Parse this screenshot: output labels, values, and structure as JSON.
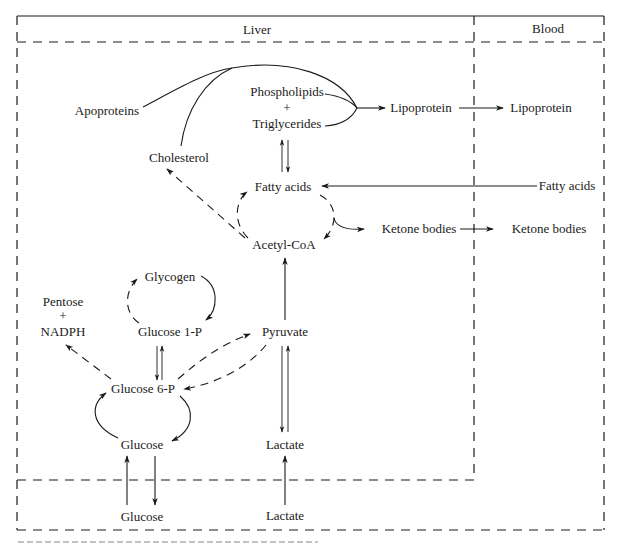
{
  "regions": {
    "liver": "Liver",
    "blood": "Blood"
  },
  "nodes": {
    "apoproteins": "Apoproteins",
    "phospholipids": "Phospholipids",
    "plus1": "+",
    "triglycerides": "Triglycerides",
    "lipoprotein_liver": "Lipoprotein",
    "lipoprotein_blood": "Lipoprotein",
    "cholesterol": "Cholesterol",
    "fatty_acids_liver": "Fatty acids",
    "fatty_acids_blood": "Fatty acids",
    "ketone_bodies_liver": "Ketone bodies",
    "ketone_bodies_blood": "Ketone bodies",
    "acetyl_coa": "Acetyl-CoA",
    "glycogen": "Glycogen",
    "pentose": "Pentose",
    "plus2": "+",
    "nadph": "NADPH",
    "glucose_1p": "Glucose 1-P",
    "pyruvate": "Pyruvate",
    "glucose_6p": "Glucose 6-P",
    "glucose_liver": "Glucose",
    "lactate_liver": "Lactate",
    "glucose_blood": "Glucose",
    "lactate_blood": "Lactate"
  },
  "edges": [
    {
      "from": "Apoproteins",
      "to": "Lipoprotein",
      "style": "solid"
    },
    {
      "from": "Cholesterol",
      "to": "Lipoprotein",
      "style": "solid"
    },
    {
      "from": "Phospholipids + Triglycerides",
      "to": "Lipoprotein",
      "style": "solid"
    },
    {
      "from": "Lipoprotein (liver)",
      "to": "Lipoprotein (blood)",
      "style": "solid"
    },
    {
      "from": "Triglycerides",
      "to": "Fatty acids",
      "style": "solid",
      "bidirectional": true
    },
    {
      "from": "Fatty acids (blood)",
      "to": "Fatty acids (liver)",
      "style": "solid"
    },
    {
      "from": "Fatty acids",
      "to": "Acetyl-CoA",
      "style": "dashed"
    },
    {
      "from": "Acetyl-CoA",
      "to": "Fatty acids",
      "style": "dashed"
    },
    {
      "from": "Acetyl-CoA",
      "to": "Cholesterol",
      "style": "dashed"
    },
    {
      "from": "Acetyl-CoA/Fatty acids cycle",
      "to": "Ketone bodies",
      "style": "solid"
    },
    {
      "from": "Ketone bodies (liver)",
      "to": "Ketone bodies (blood)",
      "style": "solid"
    },
    {
      "from": "Pyruvate",
      "to": "Acetyl-CoA",
      "style": "solid"
    },
    {
      "from": "Glycogen",
      "to": "Glucose 1-P",
      "style": "solid"
    },
    {
      "from": "Glucose 1-P",
      "to": "Glycogen",
      "style": "dashed"
    },
    {
      "from": "Glucose 1-P",
      "to": "Glucose 6-P",
      "style": "solid",
      "bidirectional": true
    },
    {
      "from": "Glucose 6-P",
      "to": "Pentose + NADPH",
      "style": "dashed"
    },
    {
      "from": "Glucose 6-P",
      "to": "Pyruvate",
      "style": "dashed"
    },
    {
      "from": "Pyruvate",
      "to": "Glucose 6-P",
      "style": "dashed"
    },
    {
      "from": "Glucose 6-P",
      "to": "Glucose",
      "style": "solid"
    },
    {
      "from": "Glucose",
      "to": "Glucose 6-P",
      "style": "solid"
    },
    {
      "from": "Pyruvate",
      "to": "Lactate",
      "style": "solid",
      "bidirectional": true
    },
    {
      "from": "Glucose (blood)",
      "to": "Glucose (liver)",
      "style": "solid"
    },
    {
      "from": "Glucose (liver)",
      "to": "Glucose (blood)",
      "style": "solid"
    },
    {
      "from": "Lactate (blood)",
      "to": "Lactate (liver)",
      "style": "solid"
    }
  ]
}
